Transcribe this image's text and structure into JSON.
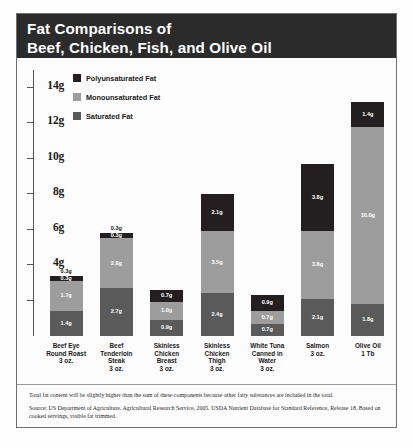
{
  "title": {
    "line1": "Fat Comparisons of",
    "line2": "Beef, Chicken, Fish, and Olive Oil"
  },
  "legend": [
    {
      "label": "Polyunsaturated Fat",
      "color": "#231f20"
    },
    {
      "label": "Monounsaturated Fat",
      "color": "#9d9d9d"
    },
    {
      "label": "Saturated Fat",
      "color": "#5a5a5a"
    }
  ],
  "y_axis": {
    "ticks": [
      "14g",
      "12g",
      "10g",
      "8g",
      "6g",
      "4g",
      "2g"
    ],
    "values": [
      14,
      12,
      10,
      8,
      6,
      4,
      2
    ]
  },
  "notes": [
    "Total fat content will be slightly higher than the sum of these components because other fatty substances are included in the total.",
    "Source: US Department of Agriculture, Agricultural Research Service, 2005. USDA Nutrient Database for Standard Reference, Release 18. Based on cooked servings, visible fat trimmed."
  ],
  "chart_data": {
    "type": "bar",
    "title": "Fat Comparisons of Beef, Chicken, Fish, and Olive Oil",
    "xlabel": "",
    "ylabel": "",
    "ylim": [
      0,
      15
    ],
    "grid": false,
    "stacked": true,
    "legend_position": "top-left",
    "categories": [
      "Beef Eye Round Roast 3 oz.",
      "Beef Tenderloin Steak 3 oz.",
      "Skinless Chicken Breast 3 oz.",
      "Skinless Chicken Thigh 3 oz.",
      "White Tuna Canned in Water 3 oz.",
      "Salmon 3 oz.",
      "Olive Oil 1 Tb"
    ],
    "category_lines": [
      [
        "Beef Eye",
        "Round Roast",
        "3 oz."
      ],
      [
        "Beef",
        "Tenderloin",
        "Steak",
        "3 oz."
      ],
      [
        "Skinless",
        "Chicken",
        "Breast",
        "3 oz."
      ],
      [
        "Skinless",
        "Chicken",
        "Thigh",
        "3 oz."
      ],
      [
        "White Tuna",
        "Canned in",
        "Water",
        "3 oz."
      ],
      [
        "Salmon",
        "3 oz."
      ],
      [
        "Olive Oil",
        "1 Tb"
      ]
    ],
    "series": [
      {
        "name": "Saturated Fat",
        "color": "#5a5a5a",
        "values": [
          1.4,
          2.7,
          0.9,
          2.4,
          0.7,
          2.1,
          1.8
        ],
        "labels": [
          "1.4g",
          "2.7g",
          "0.9g",
          "2.4g",
          "0.7g",
          "2.1g",
          "1.8g"
        ]
      },
      {
        "name": "Monounsaturated Fat",
        "color": "#9d9d9d",
        "values": [
          1.7,
          2.8,
          1.0,
          3.5,
          0.7,
          3.8,
          10.0
        ],
        "labels": [
          "1.7g",
          "2.8g",
          "1.0g",
          "3.5g",
          "0.7g",
          "3.8g",
          "10.0g"
        ]
      },
      {
        "name": "Polyunsaturated Fat",
        "color": "#231f20",
        "values": [
          0.3,
          0.3,
          0.7,
          2.1,
          0.9,
          3.8,
          1.4
        ],
        "labels": [
          "0.3g",
          "0.3g",
          "0.7g",
          "2.1g",
          "0.9g",
          "3.8g",
          "1.4g"
        ]
      }
    ],
    "top_labels": [
      "0.3g",
      "0.3g",
      "",
      "",
      "",
      "",
      ""
    ],
    "top_label_shown": [
      true,
      true,
      false,
      false,
      false,
      false,
      false
    ]
  }
}
